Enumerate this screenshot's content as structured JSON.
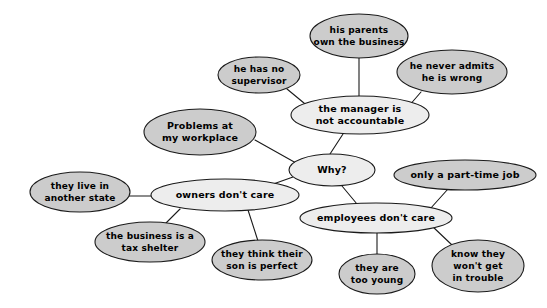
{
  "diagram": {
    "type": "mind-map",
    "background_color": "#ffffff",
    "stroke_color": "#1a1a1a",
    "fill_primary": "#cccccc",
    "fill_secondary": "#ededed",
    "nodes": [
      {
        "id": "problems",
        "label": "Problems at\nmy workplace",
        "lines": [
          "Problems at",
          "my workplace"
        ],
        "cx": 200,
        "cy": 132,
        "rx": 56,
        "ry": 23,
        "fill": "#cccccc",
        "font_size": 9.5,
        "role": "root"
      },
      {
        "id": "why",
        "label": "Why?",
        "lines": [
          "Why?"
        ],
        "cx": 332,
        "cy": 170,
        "rx": 43,
        "ry": 16,
        "fill": "#ededed",
        "font_size": 9.5,
        "role": "hub"
      },
      {
        "id": "manager",
        "label": "the manager is\nnot accountable",
        "lines": [
          "the manager is",
          "not accountable"
        ],
        "cx": 360,
        "cy": 115,
        "rx": 69,
        "ry": 19,
        "fill": "#ededed",
        "font_size": 9.5,
        "role": "branch"
      },
      {
        "id": "owners",
        "label": "owners don't care",
        "lines": [
          "owners don't care"
        ],
        "cx": 225,
        "cy": 195,
        "rx": 74,
        "ry": 16,
        "fill": "#ededed",
        "font_size": 9.5,
        "role": "branch"
      },
      {
        "id": "employees",
        "label": "employees don't care",
        "lines": [
          "employees don't care"
        ],
        "cx": 376,
        "cy": 218,
        "rx": 76,
        "ry": 15,
        "fill": "#ededed",
        "font_size": 9.5,
        "role": "branch"
      },
      {
        "id": "parents",
        "label": "his parents\nown the business",
        "lines": [
          "his parents",
          "own the business"
        ],
        "cx": 359,
        "cy": 36,
        "rx": 49,
        "ry": 22,
        "fill": "#cccccc",
        "font_size": 9,
        "role": "leaf"
      },
      {
        "id": "supervisor",
        "label": "he has no\nsupervisor",
        "lines": [
          "he has no",
          "supervisor"
        ],
        "cx": 259,
        "cy": 75,
        "rx": 41,
        "ry": 18,
        "fill": "#cccccc",
        "font_size": 9,
        "role": "leaf"
      },
      {
        "id": "never-admits",
        "label": "he never admits\nhe is wrong",
        "lines": [
          "he never admits",
          "he is wrong"
        ],
        "cx": 452,
        "cy": 72,
        "rx": 55,
        "ry": 22,
        "fill": "#cccccc",
        "font_size": 9,
        "role": "leaf"
      },
      {
        "id": "another-state",
        "label": "they live in\nanother state",
        "lines": [
          "they live in",
          "another state"
        ],
        "cx": 80,
        "cy": 192,
        "rx": 50,
        "ry": 20,
        "fill": "#cccccc",
        "font_size": 9,
        "role": "leaf"
      },
      {
        "id": "tax-shelter",
        "label": "the business is a\ntax shelter",
        "lines": [
          "the business is a",
          "tax shelter"
        ],
        "cx": 150,
        "cy": 242,
        "rx": 55,
        "ry": 20,
        "fill": "#cccccc",
        "font_size": 9,
        "role": "leaf"
      },
      {
        "id": "son-perfect",
        "label": "they think their\nson is perfect",
        "lines": [
          "they think their",
          "son is perfect"
        ],
        "cx": 262,
        "cy": 260,
        "rx": 50,
        "ry": 20,
        "fill": "#cccccc",
        "font_size": 9,
        "role": "leaf"
      },
      {
        "id": "part-time",
        "label": "only a part-time job",
        "lines": [
          "only a part-time job"
        ],
        "cx": 465,
        "cy": 175,
        "rx": 71,
        "ry": 15,
        "fill": "#cccccc",
        "font_size": 9.5,
        "role": "leaf"
      },
      {
        "id": "too-young",
        "label": "they are\ntoo young",
        "lines": [
          "they are",
          "too young"
        ],
        "cx": 377,
        "cy": 274,
        "rx": 38,
        "ry": 20,
        "fill": "#cccccc",
        "font_size": 9,
        "role": "leaf"
      },
      {
        "id": "no-trouble",
        "label": "know they\nwon't get\nin trouble",
        "lines": [
          "know they",
          "won't get",
          "in trouble"
        ],
        "cx": 478,
        "cy": 266,
        "rx": 46,
        "ry": 26,
        "fill": "#cccccc",
        "font_size": 9,
        "role": "leaf"
      }
    ],
    "edges": [
      {
        "id": "problems-why",
        "from": "problems",
        "to": "why",
        "x1": 255,
        "y1": 140,
        "x2": 296,
        "y2": 163
      },
      {
        "id": "manager-why",
        "from": "manager",
        "to": "why",
        "x1": 343,
        "y1": 134,
        "x2": 330,
        "y2": 154
      },
      {
        "id": "why-owners",
        "from": "why",
        "to": "owners",
        "x1": 293,
        "y1": 177,
        "x2": 262,
        "y2": 188
      },
      {
        "id": "why-employees",
        "from": "why",
        "to": "employees",
        "x1": 342,
        "y1": 186,
        "x2": 357,
        "y2": 204
      },
      {
        "id": "manager-parents",
        "from": "manager",
        "to": "parents",
        "x1": 359,
        "y1": 58,
        "x2": 359,
        "y2": 96
      },
      {
        "id": "manager-supervisor",
        "from": "manager",
        "to": "supervisor",
        "x1": 287,
        "y1": 89,
        "x2": 310,
        "y2": 108
      },
      {
        "id": "manager-neveradmits",
        "from": "manager",
        "to": "never-admits",
        "x1": 421,
        "y1": 92,
        "x2": 408,
        "y2": 107
      },
      {
        "id": "owners-state",
        "from": "owners",
        "to": "another-state",
        "x1": 129,
        "y1": 196,
        "x2": 153,
        "y2": 196
      },
      {
        "id": "owners-tax",
        "from": "owners",
        "to": "tax-shelter",
        "x1": 180,
        "y1": 209,
        "x2": 166,
        "y2": 223
      },
      {
        "id": "owners-son",
        "from": "owners",
        "to": "son-perfect",
        "x1": 248,
        "y1": 210,
        "x2": 258,
        "y2": 241
      },
      {
        "id": "employees-parttime",
        "from": "employees",
        "to": "part-time",
        "x1": 430,
        "y1": 209,
        "x2": 448,
        "y2": 189
      },
      {
        "id": "employees-young",
        "from": "employees",
        "to": "too-young",
        "x1": 377,
        "y1": 233,
        "x2": 377,
        "y2": 255
      },
      {
        "id": "employees-trouble",
        "from": "employees",
        "to": "no-trouble",
        "x1": 432,
        "y1": 226,
        "x2": 452,
        "y2": 245
      }
    ]
  }
}
